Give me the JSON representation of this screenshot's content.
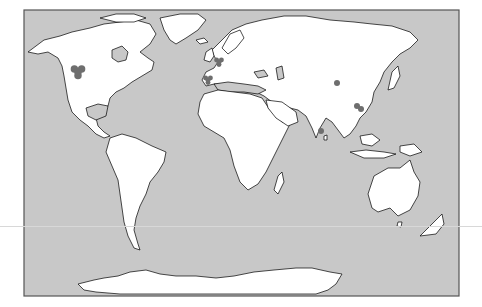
{
  "map": {
    "projection": "Miller cylindrical (world)",
    "frame": {
      "x": 24,
      "y": 10,
      "width": 435,
      "height": 286
    },
    "colors": {
      "ocean": "#c8c8c8",
      "land": "#ffffff",
      "coastline": "#000000",
      "marker": "#6e6e6e",
      "frame": "#555555"
    },
    "markers": [
      {
        "region": "North America (western interior)",
        "x": 78,
        "y": 72,
        "r": 6,
        "shape": "cluster"
      },
      {
        "region": "Western Europe (France/Britain)",
        "x": 219,
        "y": 62,
        "r": 4,
        "shape": "cluster"
      },
      {
        "region": "Iberian Peninsula",
        "x": 208,
        "y": 80,
        "r": 4,
        "shape": "cluster"
      },
      {
        "region": "Central China",
        "x": 337,
        "y": 83,
        "r": 3,
        "shape": "dot"
      },
      {
        "region": "Southeast China",
        "x": 357,
        "y": 106,
        "r": 3,
        "shape": "dot"
      },
      {
        "region": "Southeast China",
        "x": 361,
        "y": 109,
        "r": 3,
        "shape": "dot"
      },
      {
        "region": "Southern India",
        "x": 321,
        "y": 131,
        "r": 3,
        "shape": "dot"
      }
    ]
  }
}
